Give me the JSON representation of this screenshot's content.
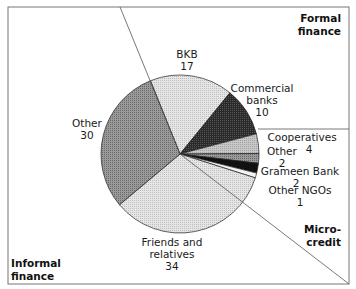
{
  "chart_data": {
    "type": "pie",
    "title": "",
    "unit": "percent",
    "slices": [
      {
        "label": "BKB",
        "value": 17,
        "group": "Formal finance"
      },
      {
        "label": "Commercial banks",
        "value": 10,
        "group": "Formal finance"
      },
      {
        "label": "Cooperatives",
        "value": 4,
        "group": "Formal finance"
      },
      {
        "label": "Other",
        "value": 2,
        "group": "Microcredit"
      },
      {
        "label": "Grameen Bank",
        "value": 2,
        "group": "Microcredit"
      },
      {
        "label": "Other NGOs",
        "value": 1,
        "group": "Microcredit"
      },
      {
        "label": "Friends and relatives",
        "value": 34,
        "group": "Informal finance"
      },
      {
        "label": "Other",
        "value": 30,
        "group": "Informal finance"
      }
    ],
    "groups": [
      "Formal finance",
      "Micro-credit",
      "Informal finance"
    ],
    "total": 100
  },
  "labels": {
    "bkb": {
      "name": "BKB",
      "value": "17"
    },
    "commercial": {
      "line1": "Commercial",
      "line2": "banks",
      "value": "10"
    },
    "cooperatives": {
      "name": "Cooperatives",
      "value": "4"
    },
    "other_micro": {
      "name": "Other",
      "value": "2"
    },
    "grameen": {
      "name": "Grameen Bank",
      "value": "2"
    },
    "other_ngos": {
      "name": "Other NGOs",
      "value": "1"
    },
    "friends": {
      "line1": "Friends and",
      "line2": "relatives",
      "value": "34"
    },
    "other_informal": {
      "name": "Other",
      "value": "30"
    }
  },
  "zones": {
    "formal": {
      "line1": "Formal",
      "line2": "finance"
    },
    "micro": {
      "line1": "Micro-",
      "line2": "credit"
    },
    "informal": {
      "line1": "Informal",
      "line2": "finance"
    }
  }
}
